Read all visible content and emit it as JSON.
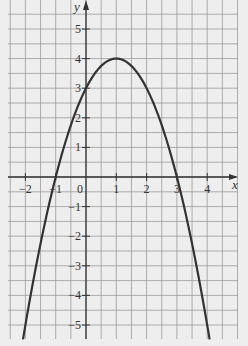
{
  "chart_data": {
    "type": "line",
    "title": "",
    "xlabel": "x",
    "ylabel": "y",
    "function": "y = -(x-1)^2 + 4",
    "xlim": [
      -2.6,
      5.0
    ],
    "ylim": [
      -5.5,
      6.0
    ],
    "grid": true,
    "grid_step": 0.5,
    "x_ticks": [
      -2,
      -1,
      0,
      1,
      2,
      3,
      4
    ],
    "x_tick_labels": [
      "−2",
      "−1",
      "0",
      "1",
      "2",
      "3",
      "4"
    ],
    "y_ticks": [
      -5,
      -4,
      -3,
      -2,
      -1,
      1,
      2,
      3,
      4,
      5
    ],
    "y_tick_labels": [
      "−5",
      "−4",
      "−3",
      "−2",
      "−1",
      "1",
      "2",
      "3",
      "4",
      "5"
    ],
    "series": [
      {
        "name": "parabola",
        "x": [
          -2.08,
          -2,
          -1.5,
          -1,
          -0.5,
          0,
          0.5,
          1,
          1.5,
          2,
          2.5,
          3,
          3.5,
          4,
          4.08
        ],
        "y": [
          -5.5,
          -5,
          -2.25,
          0,
          1.75,
          3,
          3.75,
          4,
          3.75,
          3,
          1.75,
          0,
          -2.25,
          -5,
          -5.5
        ]
      }
    ],
    "key_points": {
      "vertex": [
        1,
        4
      ],
      "x_intercepts": [
        -1,
        3
      ],
      "y_intercept": [
        0,
        3
      ]
    },
    "legend": null
  },
  "colors": {
    "background": "#eeeeee",
    "grid": "#9a9a9a",
    "axis": "#333333",
    "curve": "#333333"
  }
}
